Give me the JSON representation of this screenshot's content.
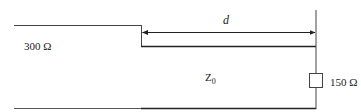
{
  "diagram": {
    "type": "transmission-line-circuit",
    "labels": {
      "source_impedance": "300 Ω",
      "line_impedance_main": "Z",
      "line_impedance_sub": "0",
      "length": "d",
      "load_impedance": "150 Ω"
    },
    "colors": {
      "line": "#333333",
      "background": "#ffffff"
    }
  }
}
